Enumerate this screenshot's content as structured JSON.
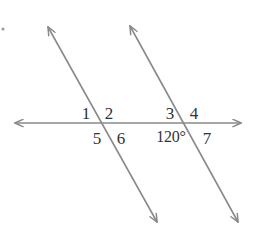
{
  "figure": {
    "width": 254,
    "height": 243,
    "background_color": "#ffffff",
    "line_color": "#8a8a8a",
    "label_color": "#333333",
    "line_width": 1.6
  },
  "geometry": {
    "lines": [
      {
        "name": "horizontal-transversal",
        "x1": 15,
        "y1": 123,
        "x2": 241,
        "y2": 123,
        "arrow_start": true,
        "arrow_end": true
      },
      {
        "name": "parallel-line-left",
        "x1": 48,
        "y1": 27,
        "x2": 157,
        "y2": 222,
        "arrow_start": true,
        "arrow_end": true
      },
      {
        "name": "parallel-line-right",
        "x1": 130,
        "y1": 26,
        "x2": 238,
        "y2": 222,
        "arrow_start": true,
        "arrow_end": true
      }
    ],
    "intersections": [
      {
        "name": "left-intersection",
        "x": 104,
        "y": 124
      },
      {
        "name": "right-intersection",
        "x": 187,
        "y": 124
      }
    ],
    "marks": [
      {
        "name": "corner-dot",
        "x": 3,
        "y": 29
      }
    ]
  },
  "labels": [
    {
      "id": "angle-1",
      "name": "angle-label-1",
      "text": "1",
      "x": 86,
      "y": 113
    },
    {
      "id": "angle-2",
      "name": "angle-label-2",
      "text": "2",
      "x": 109,
      "y": 113
    },
    {
      "id": "angle-3",
      "name": "angle-label-3",
      "text": "3",
      "x": 170,
      "y": 113
    },
    {
      "id": "angle-4",
      "name": "angle-label-4",
      "text": "4",
      "x": 194,
      "y": 113
    },
    {
      "id": "angle-5",
      "name": "angle-label-5",
      "text": "5",
      "x": 97,
      "y": 138
    },
    {
      "id": "angle-6",
      "name": "angle-label-6",
      "text": "6",
      "x": 121,
      "y": 138
    },
    {
      "id": "angle-120",
      "name": "angle-measure-120",
      "text": "120°",
      "x": 171,
      "y": 137
    },
    {
      "id": "angle-7",
      "name": "angle-label-7",
      "text": "7",
      "x": 207,
      "y": 138
    }
  ]
}
